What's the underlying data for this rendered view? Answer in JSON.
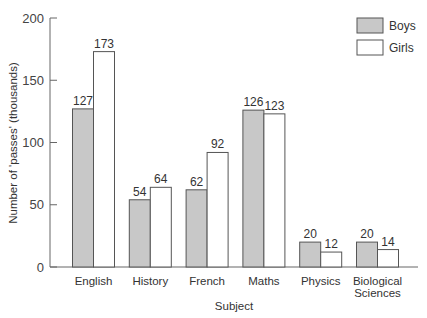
{
  "chart_data": {
    "type": "bar",
    "title": "",
    "xlabel": "Subject",
    "ylabel": "Number of 'passes' (thousands)",
    "ylim": [
      0,
      200
    ],
    "yticks": [
      0,
      50,
      100,
      150,
      200
    ],
    "grid": false,
    "legend_position": "top-right",
    "categories": [
      "English",
      "History",
      "French",
      "Maths",
      "Physics",
      "Biological Sciences"
    ],
    "category_lines": [
      [
        "English"
      ],
      [
        "History"
      ],
      [
        "French"
      ],
      [
        "Maths"
      ],
      [
        "Physics"
      ],
      [
        "Biological",
        "Sciences"
      ]
    ],
    "series": [
      {
        "name": "Boys",
        "values": [
          127,
          54,
          62,
          126,
          20,
          20
        ],
        "color": "#c8c8c8"
      },
      {
        "name": "Girls",
        "values": [
          173,
          64,
          92,
          123,
          12,
          14
        ],
        "color": "#ffffff"
      }
    ]
  },
  "colors": {
    "axis": "#666666",
    "bar_stroke": "#555555"
  }
}
